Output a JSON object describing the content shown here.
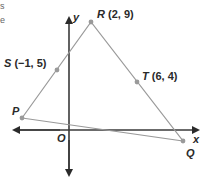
{
  "colors": {
    "axis": "#3a3a3a",
    "polygon_edge": "#9a9a9a",
    "point": "#9a9a9a",
    "text": "#2a2a2a"
  },
  "axes": {
    "x_label": "x",
    "y_label": "y",
    "origin_label": "O"
  },
  "points": {
    "R": {
      "name": "R",
      "coords": "(2, 9)"
    },
    "S": {
      "name": "S",
      "coords": "(−1, 5)"
    },
    "T": {
      "name": "T",
      "coords": "(6, 4)"
    },
    "P": {
      "name": "P"
    },
    "Q": {
      "name": "Q"
    }
  },
  "fragments": {
    "top_left_1": "s",
    "top_left_2": "e"
  },
  "polygon": [
    "P",
    "R",
    "Q"
  ]
}
